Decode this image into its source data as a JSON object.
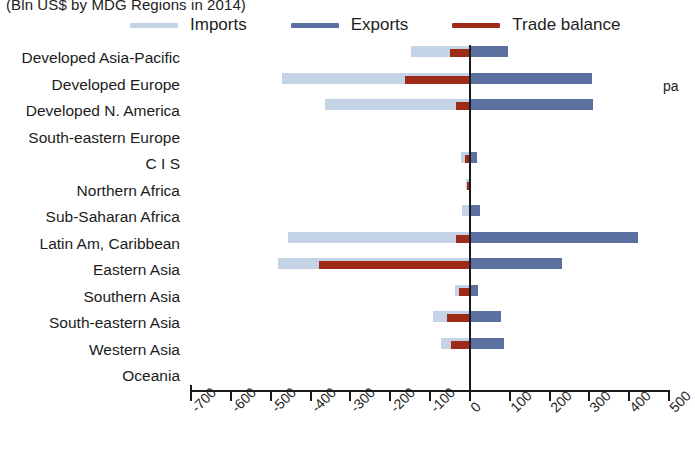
{
  "title": "(Bln US$ by MDG Regions in 2014)",
  "right_clipped_text": "pa",
  "legend": {
    "position": "top",
    "items": [
      {
        "label": "Imports",
        "color": "#c4d3e6",
        "key": "imports"
      },
      {
        "label": "Exports",
        "color": "#5b6fa0",
        "key": "exports"
      },
      {
        "label": "Trade balance",
        "color": "#9e2b18",
        "key": "balance"
      }
    ]
  },
  "chart_data": {
    "type": "bar",
    "orientation": "horizontal",
    "title": "(Bln US$ by MDG Regions in 2014)",
    "xlabel": "",
    "ylabel": "",
    "xlim": [
      -700,
      500
    ],
    "xticks": [
      -700,
      -600,
      -500,
      -400,
      -300,
      -200,
      -100,
      0,
      100,
      200,
      300,
      400,
      500
    ],
    "xticklabels": [
      "-700",
      "-600",
      "-500",
      "-400",
      "-300",
      "-200",
      "-100",
      "0",
      "100",
      "200",
      "300",
      "400",
      "500"
    ],
    "grid": false,
    "zero_line": true,
    "categories": [
      "Developed Asia-Pacific",
      "Developed Europe",
      "Developed N. America",
      "South-eastern Europe",
      "C I S",
      "Northern Africa",
      "Sub-Saharan Africa",
      "Latin Am, Caribbean",
      "Eastern Asia",
      "Southern Asia",
      "South-eastern Asia",
      "Western Asia",
      "Oceania"
    ],
    "series": [
      {
        "name": "Imports",
        "color": "#c4d3e6",
        "values": [
          -145,
          -470,
          -360,
          0,
          -20,
          -8,
          -18,
          -455,
          -480,
          -35,
          -90,
          -70,
          0
        ]
      },
      {
        "name": "Exports",
        "color": "#5b6fa0",
        "values": [
          98,
          310,
          312,
          0,
          20,
          6,
          28,
          425,
          235,
          22,
          82,
          88,
          0
        ]
      },
      {
        "name": "Trade balance",
        "color": "#9e2b18",
        "values": [
          -47,
          -160,
          -33,
          0,
          -10,
          -5,
          0,
          -33,
          -375,
          -25,
          -55,
          -45,
          0
        ]
      }
    ]
  }
}
